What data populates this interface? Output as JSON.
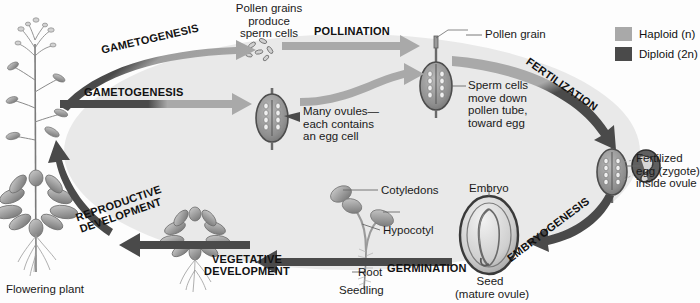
{
  "figure": {
    "type": "life-cycle-diagram",
    "background_color": "#eaeaea",
    "haploid_color": "#a8a8a8",
    "diploid_color": "#4a4a4a"
  },
  "legend": {
    "items": [
      {
        "label": "Haploid (n)",
        "color": "#a9a9a9",
        "ploidy": "n"
      },
      {
        "label": "Diploid (2n)",
        "color": "#4a4a4a",
        "ploidy": "2n"
      }
    ]
  },
  "stages": [
    {
      "id": "gametogenesis-male",
      "label": "GAMETOGENESIS",
      "from": "#4a4a4a",
      "to": "#a9a9a9"
    },
    {
      "id": "gametogenesis-female",
      "label": "GAMETOGENESIS",
      "from": "#4a4a4a",
      "to": "#a9a9a9"
    },
    {
      "id": "pollination",
      "label": "POLLINATION",
      "from": "#a9a9a9",
      "to": "#a9a9a9"
    },
    {
      "id": "fertilization",
      "label": "FERTILIZATION",
      "from": "#a9a9a9",
      "to": "#4a4a4a"
    },
    {
      "id": "embryogenesis",
      "label": "EMBRYOGENESIS",
      "from": "#4a4a4a",
      "to": "#4a4a4a"
    },
    {
      "id": "germination",
      "label": "GERMINATION",
      "from": "#4a4a4a",
      "to": "#4a4a4a"
    },
    {
      "id": "vegetative",
      "label": "VEGETATIVE\nDEVELOPMENT",
      "from": "#4a4a4a",
      "to": "#4a4a4a"
    },
    {
      "id": "reproductive",
      "label": "REPRODUCTIVE\nDEVELOPMENT",
      "from": "#4a4a4a",
      "to": "#4a4a4a"
    }
  ],
  "annotations": {
    "pollen_grains_produce": "Pollen grains\nproduce\nsperm cells",
    "pollen_grain": "Pollen grain",
    "sperm_cells_move": "Sperm cells\nmove down\npollen tube,\ntoward egg",
    "many_ovules": "Many ovules—\neach contains\nan egg cell",
    "fertilized_egg": "Fertilized\negg (zygote)\ninside ovule",
    "embryo": "Embryo",
    "seed": "Seed\n(mature ovule)",
    "cotyledons": "Cotyledons",
    "hypocotyl": "Hypocotyl",
    "root": "Root",
    "seedling": "Seedling",
    "flowering_plant": "Flowering plant"
  }
}
